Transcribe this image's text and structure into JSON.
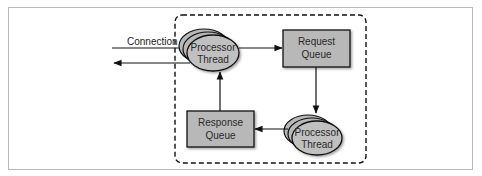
{
  "diagram": {
    "colors": {
      "node_fill": "#b8b8b8",
      "stroke": "#111111",
      "frame_border": "#b9b9b9",
      "background": "#ffffff"
    },
    "connection_label": "Connection",
    "nodes": {
      "processor_top": {
        "line1": "Processor",
        "line2": "Thread"
      },
      "request_queue": {
        "line1": "Request",
        "line2": "Queue"
      },
      "processor_bottom": {
        "line1": "Processor",
        "line2": "Thread"
      },
      "response_queue": {
        "line1": "Response",
        "line2": "Queue"
      }
    },
    "edges": [
      {
        "from": "external",
        "to": "processor_top",
        "label": "Connection"
      },
      {
        "from": "processor_top",
        "to": "external"
      },
      {
        "from": "processor_top",
        "to": "request_queue"
      },
      {
        "from": "request_queue",
        "to": "processor_bottom"
      },
      {
        "from": "processor_bottom",
        "to": "response_queue"
      },
      {
        "from": "response_queue",
        "to": "processor_top"
      }
    ]
  }
}
